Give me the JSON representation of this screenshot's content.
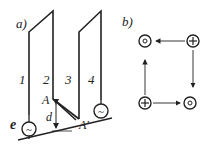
{
  "panel_a": {
    "label": "a)",
    "wire_labels": [
      "1",
      "2",
      "3",
      "4"
    ],
    "point_a": "A",
    "point_a_prime": "A'",
    "distance_label": "d",
    "source_label": "e",
    "source_symbol": "~"
  },
  "panel_b": {
    "label": "b)",
    "conductors": [
      {
        "position": "top-left",
        "symbol": "o",
        "meaning": "dot (out)"
      },
      {
        "position": "top-right",
        "symbol": "+",
        "meaning": "cross (in)"
      },
      {
        "position": "bottom-left",
        "symbol": "+",
        "meaning": "cross (in)"
      },
      {
        "position": "bottom-right",
        "symbol": "o",
        "meaning": "dot (out)"
      }
    ]
  },
  "colors": {
    "line": "#222222",
    "background": "#ffffff"
  }
}
